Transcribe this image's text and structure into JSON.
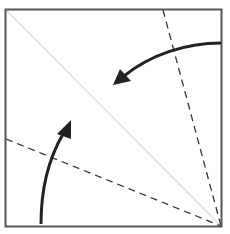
{
  "diagram": {
    "title": "Origami fold diagram: fold two edges to the diagonal",
    "colors": {
      "background": "#ffffff",
      "border": "#555555",
      "diagonal": "#e2e2e2",
      "dashed_fold": "#333333",
      "arrow": "#222222"
    },
    "square": {
      "x": 5,
      "y": 9,
      "width": 217,
      "height": 218
    },
    "diagonal_crease": {
      "x1": 5,
      "y1": 9,
      "x2": 222,
      "y2": 227,
      "style": "solid-light"
    },
    "valley_folds": [
      {
        "name": "upper-fold-line",
        "x1": 163,
        "y1": 9,
        "x2": 222,
        "y2": 227,
        "style": "dashed"
      },
      {
        "name": "lower-fold-line",
        "x1": 5,
        "y1": 139,
        "x2": 222,
        "y2": 227,
        "style": "dashed"
      }
    ],
    "arrows": [
      {
        "name": "fold-arrow-top-edge",
        "path": "M221,43 C185,43 150,55 122,78",
        "head_at": [
          113,
          84
        ],
        "direction": "left-down"
      },
      {
        "name": "fold-arrow-bottom-edge",
        "path": "M41,224 C41,185 50,155 64,132",
        "head_at": [
          70,
          121
        ],
        "direction": "up"
      }
    ]
  }
}
